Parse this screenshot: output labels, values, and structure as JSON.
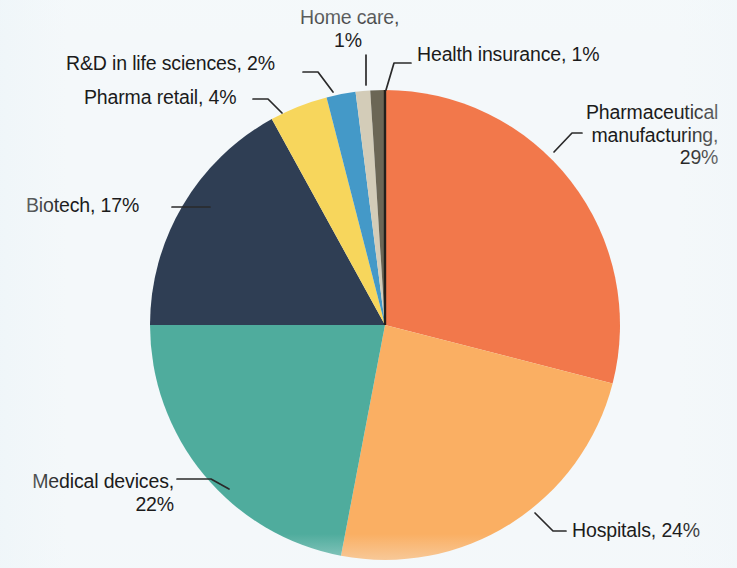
{
  "chart_data": {
    "type": "pie",
    "title": "",
    "subtitle": "",
    "xlabel": "",
    "ylabel": "",
    "legend_position": "none",
    "grid": false,
    "label_format": "{name}, {value}%",
    "start_angle_deg": 0,
    "direction": "clockwise",
    "units": "percent",
    "total": 100,
    "categories": [
      "Pharmaceutical manufacturing",
      "Hospitals",
      "Medical devices",
      "Biotech",
      "Pharma retail",
      "R&D in life sciences",
      "Home care",
      "Health insurance"
    ],
    "values": [
      29,
      24,
      22,
      17,
      4,
      2,
      1,
      1
    ],
    "colors": [
      "#f2784b",
      "#faaf63",
      "#4fac9d",
      "#2f3e54",
      "#f7d65c",
      "#4499c8",
      "#d3ccb8",
      "#6b6655"
    ],
    "slices": [
      {
        "name": "Pharmaceutical manufacturing",
        "value": 29,
        "color": "#f2784b",
        "label": "Pharmaceutical\nmanufacturing,\n29%",
        "label_position": "right"
      },
      {
        "name": "Hospitals",
        "value": 24,
        "color": "#faaf63",
        "label": "Hospitals, 24%",
        "label_position": "bottom-right"
      },
      {
        "name": "Medical devices",
        "value": 22,
        "color": "#4fac9d",
        "label": "Medical devices,\n22%",
        "label_position": "bottom-left"
      },
      {
        "name": "Biotech",
        "value": 17,
        "color": "#2f3e54",
        "label": "Biotech, 17%",
        "label_position": "left"
      },
      {
        "name": "Pharma retail",
        "value": 4,
        "color": "#f7d65c",
        "label": "Pharma retail, 4%",
        "label_position": "top-left"
      },
      {
        "name": "R&D in life sciences",
        "value": 2,
        "color": "#4499c8",
        "label": "R&D in life sciences, 2%",
        "label_position": "top-left"
      },
      {
        "name": "Home care",
        "value": 1,
        "color": "#d3ccb8",
        "label": "Home care,\n1%",
        "label_position": "top"
      },
      {
        "name": "Health insurance",
        "value": 1,
        "color": "#6b6655",
        "label": "Health insurance, 1%",
        "label_position": "top-right"
      }
    ]
  },
  "figure": {
    "background_color": "#f4f8fa",
    "text_color": "#1b1b1b",
    "leader_line_color": "#2a2a2a",
    "center_x": 385,
    "center_y": 325,
    "radius": 235
  }
}
